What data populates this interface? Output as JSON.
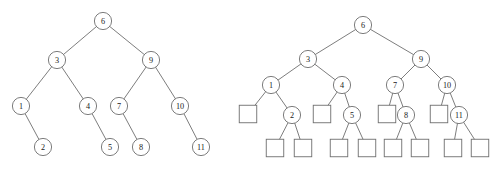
{
  "figure": {
    "background_color": "#ffffff",
    "stroke_color": "#6e6e6e",
    "label_color": "#1a1a1a",
    "node_fill": "#ffffff"
  },
  "trees": [
    {
      "id": "left-tree",
      "name": "binary-tree-internal-nodes-only",
      "caption": "",
      "circle_radius": 8.6,
      "nodes": [
        {
          "id": "L6",
          "label": "6",
          "x": 103,
          "y": 21,
          "shape": "circle"
        },
        {
          "id": "L3",
          "label": "3",
          "x": 57,
          "y": 60,
          "shape": "circle"
        },
        {
          "id": "L9",
          "label": "9",
          "x": 151,
          "y": 60,
          "shape": "circle"
        },
        {
          "id": "L1",
          "label": "1",
          "x": 21,
          "y": 106,
          "shape": "circle"
        },
        {
          "id": "L4",
          "label": "4",
          "x": 88,
          "y": 106,
          "shape": "circle"
        },
        {
          "id": "L7",
          "label": "7",
          "x": 119,
          "y": 106,
          "shape": "circle"
        },
        {
          "id": "L10",
          "label": "10",
          "x": 180,
          "y": 106,
          "shape": "circle"
        },
        {
          "id": "L2",
          "label": "2",
          "x": 43,
          "y": 147,
          "shape": "circle"
        },
        {
          "id": "L5",
          "label": "5",
          "x": 110,
          "y": 147,
          "shape": "circle"
        },
        {
          "id": "L8",
          "label": "8",
          "x": 141,
          "y": 147,
          "shape": "circle"
        },
        {
          "id": "L11",
          "label": "11",
          "x": 201,
          "y": 147,
          "shape": "circle"
        }
      ],
      "edges": [
        {
          "from": "L6",
          "to": "L3"
        },
        {
          "from": "L6",
          "to": "L9"
        },
        {
          "from": "L3",
          "to": "L1"
        },
        {
          "from": "L3",
          "to": "L4"
        },
        {
          "from": "L9",
          "to": "L7"
        },
        {
          "from": "L9",
          "to": "L10"
        },
        {
          "from": "L1",
          "to": "L2"
        },
        {
          "from": "L4",
          "to": "L5"
        },
        {
          "from": "L7",
          "to": "L8"
        },
        {
          "from": "L10",
          "to": "L11"
        }
      ]
    },
    {
      "id": "right-tree",
      "name": "binary-tree-with-external-square-nodes",
      "caption": "",
      "circle_radius": 8.6,
      "square_size": 17.5,
      "nodes": [
        {
          "id": "R6",
          "label": "6",
          "x": 363,
          "y": 25,
          "shape": "circle"
        },
        {
          "id": "R3",
          "label": "3",
          "x": 308,
          "y": 59,
          "shape": "circle"
        },
        {
          "id": "R9",
          "label": "9",
          "x": 421,
          "y": 59,
          "shape": "circle"
        },
        {
          "id": "R1",
          "label": "1",
          "x": 271,
          "y": 85,
          "shape": "circle"
        },
        {
          "id": "R4",
          "label": "4",
          "x": 342,
          "y": 85,
          "shape": "circle"
        },
        {
          "id": "R7",
          "label": "7",
          "x": 395,
          "y": 85,
          "shape": "circle"
        },
        {
          "id": "R10",
          "label": "10",
          "x": 447,
          "y": 85,
          "shape": "circle"
        },
        {
          "id": "R2",
          "label": "2",
          "x": 292,
          "y": 115,
          "shape": "circle"
        },
        {
          "id": "R5",
          "label": "5",
          "x": 352,
          "y": 115,
          "shape": "circle"
        },
        {
          "id": "R8",
          "label": "8",
          "x": 406,
          "y": 115,
          "shape": "circle"
        },
        {
          "id": "R11",
          "label": "11",
          "x": 459,
          "y": 115,
          "shape": "circle"
        },
        {
          "id": "S1",
          "label": "",
          "x": 248,
          "y": 114,
          "shape": "square"
        },
        {
          "id": "S2",
          "label": "",
          "x": 322,
          "y": 114,
          "shape": "square"
        },
        {
          "id": "S3",
          "label": "",
          "x": 387,
          "y": 114,
          "shape": "square"
        },
        {
          "id": "S4",
          "label": "",
          "x": 439,
          "y": 114,
          "shape": "square"
        },
        {
          "id": "S5",
          "label": "",
          "x": 275,
          "y": 148,
          "shape": "square"
        },
        {
          "id": "S6",
          "label": "",
          "x": 303,
          "y": 148,
          "shape": "square"
        },
        {
          "id": "S7",
          "label": "",
          "x": 339,
          "y": 148,
          "shape": "square"
        },
        {
          "id": "S8",
          "label": "",
          "x": 367,
          "y": 148,
          "shape": "square"
        },
        {
          "id": "S9",
          "label": "",
          "x": 393,
          "y": 148,
          "shape": "square"
        },
        {
          "id": "S10",
          "label": "",
          "x": 420,
          "y": 148,
          "shape": "square"
        },
        {
          "id": "S11",
          "label": "",
          "x": 453,
          "y": 148,
          "shape": "square"
        },
        {
          "id": "S12",
          "label": "",
          "x": 480,
          "y": 148,
          "shape": "square"
        }
      ],
      "edges": [
        {
          "from": "R6",
          "to": "R3"
        },
        {
          "from": "R6",
          "to": "R9"
        },
        {
          "from": "R3",
          "to": "R1"
        },
        {
          "from": "R3",
          "to": "R4"
        },
        {
          "from": "R9",
          "to": "R7"
        },
        {
          "from": "R9",
          "to": "R10"
        },
        {
          "from": "R1",
          "to": "S1"
        },
        {
          "from": "R1",
          "to": "R2"
        },
        {
          "from": "R4",
          "to": "S2"
        },
        {
          "from": "R4",
          "to": "R5"
        },
        {
          "from": "R7",
          "to": "S3"
        },
        {
          "from": "R7",
          "to": "R8"
        },
        {
          "from": "R10",
          "to": "S4"
        },
        {
          "from": "R10",
          "to": "R11"
        },
        {
          "from": "R2",
          "to": "S5"
        },
        {
          "from": "R2",
          "to": "S6"
        },
        {
          "from": "R5",
          "to": "S7"
        },
        {
          "from": "R5",
          "to": "S8"
        },
        {
          "from": "R8",
          "to": "S9"
        },
        {
          "from": "R8",
          "to": "S10"
        },
        {
          "from": "R11",
          "to": "S11"
        },
        {
          "from": "R11",
          "to": "S12"
        }
      ]
    }
  ]
}
